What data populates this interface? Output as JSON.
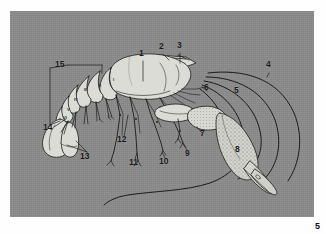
{
  "figure": {
    "kind": "anatomical-illustration",
    "background_color": "#8b8b8b",
    "body_fill_color": "#dcdcd6",
    "line_color": "#1a1a1a",
    "page_number": "5"
  },
  "labels": [
    {
      "id": "1",
      "text": "1",
      "x": 131,
      "y": 44
    },
    {
      "id": "2",
      "text": "2",
      "x": 151,
      "y": 37
    },
    {
      "id": "3",
      "text": "3",
      "x": 169,
      "y": 36
    },
    {
      "id": "4",
      "text": "4",
      "x": 258,
      "y": 55
    },
    {
      "id": "5",
      "text": "5",
      "x": 226,
      "y": 81
    },
    {
      "id": "6",
      "text": "6",
      "x": 196,
      "y": 85
    },
    {
      "id": "7",
      "text": "7",
      "x": 194,
      "y": 125
    },
    {
      "id": "8",
      "text": "8",
      "x": 228,
      "y": 140
    },
    {
      "id": "9",
      "text": "9",
      "x": 178,
      "y": 143
    },
    {
      "id": "10",
      "text": "10",
      "x": 152,
      "y": 151
    },
    {
      "id": "11",
      "text": "11",
      "x": 122,
      "y": 152
    },
    {
      "id": "12",
      "text": "12",
      "x": 110,
      "y": 130
    },
    {
      "id": "13",
      "text": "13",
      "x": 75,
      "y": 145
    },
    {
      "id": "14",
      "text": "14",
      "x": 37,
      "y": 118
    },
    {
      "id": "15",
      "text": "15",
      "x": 49,
      "y": 56
    }
  ],
  "segment_numerals": [
    {
      "text": "I",
      "x": 105,
      "y": 68
    },
    {
      "text": "II",
      "x": 91,
      "y": 74
    },
    {
      "text": "III",
      "x": 77,
      "y": 78
    },
    {
      "text": "IV",
      "x": 67,
      "y": 88
    },
    {
      "text": "V",
      "x": 60,
      "y": 98
    },
    {
      "text": "VI",
      "x": 57,
      "y": 106
    }
  ]
}
